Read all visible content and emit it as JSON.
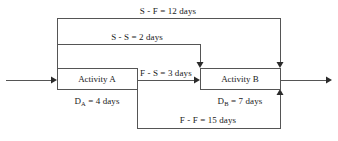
{
  "diagram": {
    "type": "precedence-network-diagram",
    "line_color": "#555555",
    "text_color": "#1a1a1a",
    "background": "#ffffff",
    "activities": [
      {
        "id": "activity-a",
        "label": "Activity A",
        "duration_prefix": "D",
        "duration_subscript": "A",
        "duration_text": " = 4 days",
        "duration_full": "Dₐ = 4 days",
        "duration_days": 4,
        "x": 57,
        "y": 68,
        "w": 80,
        "h": 21
      },
      {
        "id": "activity-b",
        "label": "Activity B",
        "duration_prefix": "D",
        "duration_subscript": "B",
        "duration_text": " = 7 days",
        "duration_full": "Dʙ = 7 days",
        "duration_days": 7,
        "x": 200,
        "y": 68,
        "w": 80,
        "h": 21
      }
    ],
    "relationships": [
      {
        "id": "sf",
        "label": "S - F = 12 days",
        "type": "start-to-finish",
        "days": 12
      },
      {
        "id": "ss",
        "label": "S - S = 2 days",
        "type": "start-to-start",
        "days": 2
      },
      {
        "id": "fs",
        "label": "F - S = 3 days",
        "type": "finish-to-start",
        "days": 3
      },
      {
        "id": "ff",
        "label": "F - F = 15 days",
        "type": "finish-to-finish",
        "days": 15
      }
    ]
  }
}
